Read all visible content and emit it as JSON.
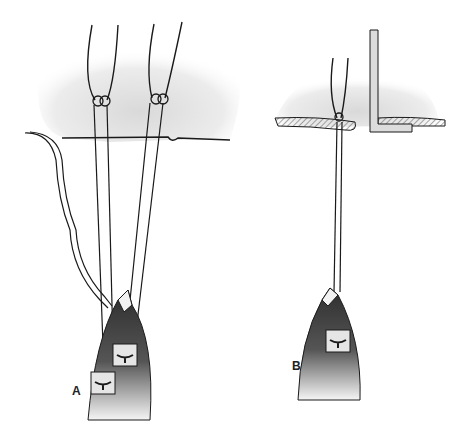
{
  "figure": {
    "panels": [
      {
        "id": "A",
        "label": "A"
      },
      {
        "id": "B",
        "label": "B"
      }
    ]
  },
  "colors": {
    "line": "#1a1a1a",
    "membrane": "#e6e6e6",
    "tissue_dark": "#3a3a3a",
    "background": "#ffffff"
  }
}
